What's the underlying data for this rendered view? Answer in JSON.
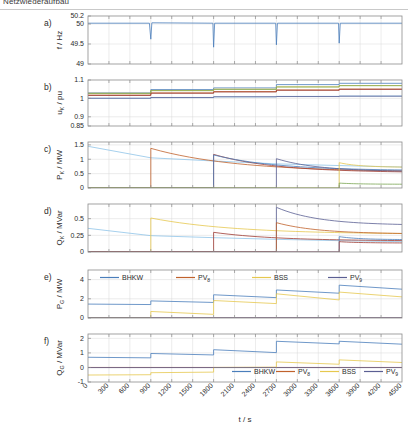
{
  "figure": {
    "title": "Netzwiederaufbau",
    "xlabel": "t / s"
  },
  "chart_data": {
    "type": "line",
    "title": "Netzwiederaufbau",
    "xlabel": "t / s",
    "xlim": [
      0,
      4500
    ],
    "xticks": [
      0,
      300,
      600,
      900,
      1200,
      1500,
      1800,
      2100,
      2400,
      2700,
      3000,
      3300,
      3600,
      3900,
      4200,
      4500
    ],
    "grid": true,
    "legend_position": "inside",
    "switching_events_s": [
      900,
      1800,
      2700,
      3600
    ],
    "colors": {
      "bhkw": "#4a7ebb",
      "pv8": "#c0622c",
      "bss": "#e6c84f",
      "pv9": "#5b5f93",
      "light_blue": "#8fc4e8",
      "green": "#7aa653",
      "dark_red": "#9e3b34",
      "grid_line": "#d8d8d8",
      "frame": "#8c8c8c"
    },
    "panels": [
      {
        "id": "a",
        "label": "a)",
        "ylabel": "f / Hz",
        "ylim": [
          49,
          50.2
        ],
        "yticks": [
          49,
          49.5,
          50,
          50.2
        ],
        "ytick_labels": [
          "49",
          "49.5",
          "50",
          "50.2"
        ],
        "description": "Grid frequency with transient dips at each switching event",
        "series": [
          {
            "name": "f",
            "color": "#4a7ebb",
            "points": [
              [
                0,
                50.02
              ],
              [
                880,
                50.02
              ],
              [
                900,
                49.62
              ],
              [
                915,
                50.03
              ],
              [
                1790,
                50.02
              ],
              [
                1800,
                49.42
              ],
              [
                1815,
                50.02
              ],
              [
                2690,
                50.02
              ],
              [
                2700,
                49.48
              ],
              [
                2715,
                50.02
              ],
              [
                3590,
                50.02
              ],
              [
                3600,
                49.52
              ],
              [
                3615,
                50.02
              ],
              [
                4500,
                50.02
              ]
            ]
          }
        ]
      },
      {
        "id": "b",
        "label": "b)",
        "ylabel": "u_K / pu",
        "ylabel_base": "u",
        "ylabel_sub": "K",
        "ylabel_unit": " / pu",
        "ylim": [
          0.85,
          1.1
        ],
        "yticks": [
          0.85,
          0.9,
          1,
          1.1
        ],
        "ytick_labels": [
          "0.85",
          "0.9",
          "1",
          "1.1"
        ],
        "description": "Node voltages in per unit, stepping upward at each connection event",
        "series": [
          {
            "name": "u1",
            "color": "#8fc4e8",
            "values": [
              1.0,
              1.004,
              1.008,
              1.011,
              1.013
            ]
          },
          {
            "name": "u2",
            "color": "#4a7ebb",
            "values": [
              1.03,
              1.048,
              1.057,
              1.075,
              1.082
            ]
          },
          {
            "name": "u3",
            "color": "#c0622c",
            "values": [
              1.018,
              1.03,
              1.037,
              1.046,
              1.051
            ]
          },
          {
            "name": "u4",
            "color": "#e6c84f",
            "values": [
              1.028,
              1.043,
              1.05,
              1.063,
              1.07
            ]
          },
          {
            "name": "u5",
            "color": "#5b5f93",
            "values": [
              1.001,
              1.005,
              1.009,
              1.01,
              1.012
            ]
          },
          {
            "name": "u6",
            "color": "#7aa653",
            "values": [
              1.027,
              1.042,
              1.049,
              1.062,
              1.069
            ]
          },
          {
            "name": "u7",
            "color": "#9e3b34",
            "values": [
              1.016,
              1.028,
              1.035,
              1.044,
              1.049
            ]
          }
        ]
      },
      {
        "id": "c",
        "label": "c)",
        "ylabel": "P_K / MW",
        "ylabel_base": "P",
        "ylabel_sub": "K",
        "ylabel_unit": " / MW",
        "ylim": [
          0,
          1.6
        ],
        "yticks": [
          0,
          0.5,
          1,
          1.5
        ],
        "ytick_labels": [
          "0",
          "0.5",
          "1",
          "1.5"
        ],
        "description": "Load active power per cluster, decaying after each reconnection step",
        "series": [
          {
            "name": "c_lightblue",
            "color": "#8fc4e8",
            "decay": [
              [
                0,
                1.45
              ],
              [
                900,
                1.05
              ],
              [
                1800,
                0.94
              ],
              [
                2700,
                0.84
              ],
              [
                3600,
                0.78
              ],
              [
                4500,
                0.73
              ]
            ]
          },
          {
            "name": "c_orange",
            "color": "#c0622c",
            "onset": 900,
            "start": 1.38,
            "end": 0.55
          },
          {
            "name": "c_darkred",
            "color": "#9e3b34",
            "onset": 1800,
            "start": 1.17,
            "end": 0.53
          },
          {
            "name": "c_blue",
            "color": "#4a7ebb",
            "onset": 1800,
            "start": 1.15,
            "end": 0.6
          },
          {
            "name": "c_navy",
            "color": "#5b5f93",
            "onset": 2700,
            "start": 1.02,
            "end": 0.57
          },
          {
            "name": "c_yellow",
            "color": "#e6c84f",
            "onset": 3600,
            "start": 0.88,
            "end": 0.72
          },
          {
            "name": "c_green",
            "color": "#7aa653",
            "onset": 3600,
            "start": 0.17,
            "end": 0.13
          }
        ]
      },
      {
        "id": "d",
        "label": "d)",
        "ylabel": "Q_K / MVar",
        "ylabel_base": "Q",
        "ylabel_sub": "K",
        "ylabel_unit": " / MVar",
        "ylim": [
          0,
          0.72
        ],
        "yticks": [
          0,
          0.25,
          0.5
        ],
        "ytick_labels": [
          "0",
          "0.25",
          "0.5"
        ],
        "description": "Load reactive power per cluster",
        "series": [
          {
            "name": "d_lightblue",
            "color": "#8fc4e8",
            "decay": [
              [
                0,
                0.355
              ],
              [
                900,
                0.245
              ],
              [
                1800,
                0.215
              ],
              [
                2700,
                0.19
              ],
              [
                3600,
                0.17
              ],
              [
                4500,
                0.155
              ]
            ]
          },
          {
            "name": "d_yellow",
            "color": "#e6c84f",
            "onset": 900,
            "start": 0.51,
            "end": 0.265
          },
          {
            "name": "d_darkred",
            "color": "#9e3b34",
            "onset": 1800,
            "start": 0.295,
            "end": 0.165
          },
          {
            "name": "d_navy_big",
            "color": "#5b5f93",
            "onset": 2700,
            "start": 0.67,
            "end": 0.4
          },
          {
            "name": "d_orange",
            "color": "#c0622c",
            "onset": 2700,
            "start": 0.44,
            "end": 0.27
          },
          {
            "name": "d_blue",
            "color": "#4a7ebb",
            "onset": 3600,
            "start": 0.23,
            "end": 0.185
          },
          {
            "name": "d_red2",
            "color": "#9e3b34",
            "onset": 3600,
            "start": 0.155,
            "end": 0.135
          }
        ]
      },
      {
        "id": "e",
        "label": "e)",
        "ylabel": "P_G / MW",
        "ylabel_base": "P",
        "ylabel_sub": "G",
        "ylabel_unit": " / MW",
        "ylim": [
          0,
          5
        ],
        "yticks": [
          0,
          2,
          4
        ],
        "ytick_labels": [
          "0",
          "2",
          "4"
        ],
        "description": "Generator active power output",
        "legend": [
          {
            "label": "BHKW",
            "sub": "",
            "color": "#4a7ebb"
          },
          {
            "label": "PV",
            "sub": "8",
            "color": "#c0622c"
          },
          {
            "label": "BSS",
            "sub": "",
            "color": "#e6c84f"
          },
          {
            "label": "PV",
            "sub": "9",
            "color": "#5b5f93"
          }
        ],
        "series": [
          {
            "name": "BHKW",
            "color": "#4a7ebb",
            "segments": [
              [
                0,
                1.45,
                1.4
              ],
              [
                900,
                1.78,
                1.62
              ],
              [
                1800,
                2.42,
                2.12
              ],
              [
                2700,
                2.92,
                2.58
              ],
              [
                3600,
                3.42,
                3.0
              ]
            ]
          },
          {
            "name": "PV8",
            "color": "#c0622c",
            "segments": [
              [
                0,
                0.02,
                0.02
              ],
              [
                900,
                0.02,
                0.02
              ],
              [
                1800,
                0.02,
                0.02
              ],
              [
                2700,
                0.02,
                0.02
              ],
              [
                3600,
                0.02,
                0.02
              ]
            ]
          },
          {
            "name": "BSS",
            "color": "#e6c84f",
            "segments": [
              [
                0,
                0.02,
                0.02
              ],
              [
                900,
                0.68,
                0.38
              ],
              [
                1800,
                1.82,
                1.5
              ],
              [
                2700,
                2.52,
                1.88
              ],
              [
                3600,
                2.7,
                2.2
              ]
            ]
          },
          {
            "name": "PV9",
            "color": "#5b5f93",
            "segments": [
              [
                0,
                0.03,
                0.03
              ],
              [
                900,
                0.03,
                0.03
              ],
              [
                1800,
                0.03,
                0.03
              ],
              [
                2700,
                0.03,
                0.03
              ],
              [
                3600,
                0.03,
                0.03
              ]
            ]
          }
        ]
      },
      {
        "id": "f",
        "label": "f)",
        "ylabel": "Q_G / MVar",
        "ylabel_base": "Q",
        "ylabel_sub": "G",
        "ylabel_unit": " / MVar",
        "ylim": [
          -1,
          2.3
        ],
        "yticks": [
          -1,
          0,
          1,
          2
        ],
        "ytick_labels": [
          "-1",
          "0",
          "1",
          "2"
        ],
        "description": "Generator reactive power output",
        "legend": [
          {
            "label": "BHKW",
            "sub": "",
            "color": "#4a7ebb"
          },
          {
            "label": "PV",
            "sub": "8",
            "color": "#c0622c"
          },
          {
            "label": "BSS",
            "sub": "",
            "color": "#e6c84f"
          },
          {
            "label": "PV",
            "sub": "9",
            "color": "#5b5f93"
          }
        ],
        "series": [
          {
            "name": "BHKW",
            "color": "#4a7ebb",
            "segments": [
              [
                0,
                0.7,
                0.66
              ],
              [
                900,
                0.96,
                0.86
              ],
              [
                1800,
                1.22,
                1.02
              ],
              [
                2700,
                1.8,
                1.62
              ],
              [
                3600,
                1.8,
                1.6
              ]
            ]
          },
          {
            "name": "PV8",
            "color": "#c0622c",
            "segments": [
              [
                0,
                0.0,
                0.0
              ],
              [
                900,
                0.0,
                0.0
              ],
              [
                1800,
                0.0,
                0.0
              ],
              [
                2700,
                0.0,
                0.0
              ],
              [
                3600,
                0.0,
                0.0
              ]
            ]
          },
          {
            "name": "BSS",
            "color": "#e6c84f",
            "segments": [
              [
                0,
                -0.52,
                -0.5
              ],
              [
                900,
                -0.36,
                -0.32
              ],
              [
                1800,
                0.0,
                0.02
              ],
              [
                2700,
                0.38,
                0.22
              ],
              [
                3600,
                0.52,
                0.34
              ]
            ]
          },
          {
            "name": "PV9",
            "color": "#5b5f93",
            "segments": [
              [
                0,
                -0.01,
                -0.01
              ],
              [
                900,
                -0.01,
                -0.01
              ],
              [
                1800,
                -0.01,
                -0.01
              ],
              [
                2700,
                -0.01,
                -0.01
              ],
              [
                3600,
                -0.01,
                -0.01
              ]
            ]
          }
        ]
      }
    ]
  }
}
